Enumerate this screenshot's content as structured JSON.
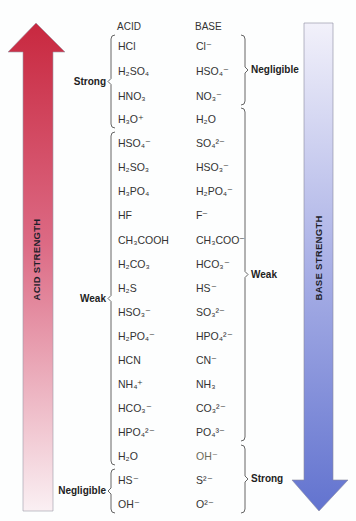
{
  "header": {
    "acid_label": "ACID",
    "base_label": "BASE"
  },
  "arrows": {
    "acid": {
      "label": "ACID STRENGTH",
      "direction": "up",
      "color_top": "#c8283f",
      "color_bottom": "#f7e9ee"
    },
    "base": {
      "label": "BASE STRENGTH",
      "direction": "down",
      "color_top": "#eeeef8",
      "color_bottom": "#6575cf"
    }
  },
  "pairs": [
    {
      "acid": "HCl",
      "base": "Cl⁻"
    },
    {
      "acid": "H₂SO₄",
      "base": "HSO₄⁻"
    },
    {
      "acid": "HNO₃",
      "base": "NO₃⁻"
    },
    {
      "acid": "H₃O⁺",
      "base": "H₂O"
    },
    {
      "acid": "HSO₄⁻",
      "base": "SO₄²⁻"
    },
    {
      "acid": "H₂SO₃",
      "base": "HSO₃⁻"
    },
    {
      "acid": "H₃PO₄",
      "base": "H₂PO₄⁻"
    },
    {
      "acid": "HF",
      "base": "F⁻"
    },
    {
      "acid": "CH₃COOH",
      "base": "CH₃COO⁻"
    },
    {
      "acid": "H₂CO₃",
      "base": "HCO₃⁻"
    },
    {
      "acid": "H₂S",
      "base": "HS⁻"
    },
    {
      "acid": "HSO₃⁻",
      "base": "SO₃²⁻"
    },
    {
      "acid": "H₂PO₄⁻",
      "base": "HPO₄²⁻"
    },
    {
      "acid": "HCN",
      "base": "CN⁻"
    },
    {
      "acid": "NH₄⁺",
      "base": "NH₃"
    },
    {
      "acid": "HCO₃⁻",
      "base": "CO₃²⁻"
    },
    {
      "acid": "HPO₄²⁻",
      "base": "PO₄³⁻"
    },
    {
      "acid": "H₂O",
      "base": "OH⁻"
    },
    {
      "acid": "HS⁻",
      "base": "S²⁻"
    },
    {
      "acid": "OH⁻",
      "base": "O²⁻"
    }
  ],
  "acid_groups": [
    {
      "label": "Strong",
      "from": 0,
      "to": 3
    },
    {
      "label": "Weak",
      "from": 4,
      "to": 17
    },
    {
      "label": "Negligible",
      "from": 18,
      "to": 19
    }
  ],
  "base_groups": [
    {
      "label": "Negligible",
      "from": 0,
      "to": 2
    },
    {
      "label": "Weak",
      "from": 3,
      "to": 16
    },
    {
      "label": "Strong",
      "from": 17,
      "to": 19
    }
  ]
}
